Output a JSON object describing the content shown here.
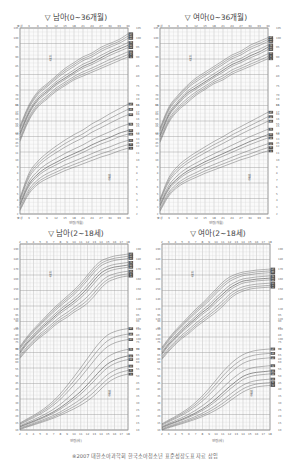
{
  "chart_data": [
    {
      "type": "line",
      "title": "▽ 남아(0~36개월)",
      "xlabel": "연령(개월)",
      "x_ticks": [
        "출생",
        "3",
        "6",
        "9",
        "12",
        "15",
        "18",
        "21",
        "24",
        "27",
        "30",
        "33",
        "36"
      ],
      "x": [
        0,
        3,
        6,
        9,
        12,
        15,
        18,
        21,
        24,
        27,
        30,
        33,
        36
      ],
      "upper_label": "신장",
      "lower_label": "체중",
      "height_ylim": [
        45,
        105
      ],
      "weight_ylim": [
        2,
        19
      ],
      "percentiles": [
        "3",
        "5",
        "10",
        "25",
        "50",
        "75",
        "90",
        "95",
        "97"
      ],
      "series": [
        {
          "name": "신장 50th",
          "values": [
            50,
            61,
            68,
            72,
            76,
            79,
            82,
            85,
            87,
            89.5,
            92,
            94,
            96
          ]
        },
        {
          "name": "신장 3rd",
          "values": [
            46,
            57,
            64,
            68,
            72,
            75,
            78,
            80,
            82,
            84,
            86,
            88,
            90
          ]
        },
        {
          "name": "신장 97th",
          "values": [
            54,
            65,
            72,
            76,
            80,
            84,
            87,
            90,
            92,
            95,
            97,
            99,
            102
          ]
        },
        {
          "name": "체중 50th",
          "values": [
            3.4,
            6.4,
            7.9,
            8.9,
            9.6,
            10.3,
            10.9,
            11.5,
            12.2,
            12.8,
            13.3,
            13.9,
            14.3
          ]
        },
        {
          "name": "체중 3rd",
          "values": [
            2.5,
            5.0,
            6.4,
            7.2,
            7.8,
            8.4,
            8.9,
            9.4,
            9.9,
            10.4,
            10.8,
            11.3,
            11.7
          ]
        },
        {
          "name": "체중 97th",
          "values": [
            4.4,
            8.0,
            9.8,
            11.0,
            12.0,
            12.9,
            13.7,
            14.4,
            15.3,
            16.0,
            16.8,
            17.5,
            18.2
          ]
        }
      ]
    },
    {
      "type": "line",
      "title": "▽ 여아(0~36개월)",
      "xlabel": "연령(개월)",
      "x_ticks": [
        "출생",
        "3",
        "6",
        "9",
        "12",
        "15",
        "18",
        "21",
        "24",
        "27",
        "30",
        "33",
        "36"
      ],
      "x": [
        0,
        3,
        6,
        9,
        12,
        15,
        18,
        21,
        24,
        27,
        30,
        33,
        36
      ],
      "upper_label": "신장",
      "lower_label": "체중",
      "height_ylim": [
        45,
        105
      ],
      "weight_ylim": [
        2,
        19
      ],
      "percentiles": [
        "3",
        "5",
        "10",
        "25",
        "50",
        "75",
        "90",
        "95",
        "97"
      ],
      "series": [
        {
          "name": "신장 50th",
          "values": [
            49,
            60,
            66,
            71,
            74,
            77,
            80,
            83,
            86,
            88,
            90.5,
            92.5,
            95
          ]
        },
        {
          "name": "신장 3rd",
          "values": [
            45.5,
            56,
            62,
            66,
            70,
            73,
            76,
            78,
            81,
            83,
            85,
            87,
            89
          ]
        },
        {
          "name": "신장 97th",
          "values": [
            53,
            64,
            70,
            75,
            79,
            82,
            85,
            88,
            91,
            93,
            96,
            98,
            100
          ]
        },
        {
          "name": "체중 50th",
          "values": [
            3.3,
            5.9,
            7.3,
            8.3,
            9.0,
            9.7,
            10.3,
            10.9,
            11.5,
            12.1,
            12.7,
            13.2,
            13.7
          ]
        },
        {
          "name": "체중 3rd",
          "values": [
            2.4,
            4.7,
            6.0,
            6.8,
            7.4,
            8.0,
            8.5,
            9.0,
            9.5,
            10.0,
            10.4,
            10.9,
            11.3
          ]
        },
        {
          "name": "체중 97th",
          "values": [
            4.2,
            7.4,
            9.1,
            10.2,
            11.1,
            11.9,
            12.7,
            13.4,
            14.2,
            14.9,
            15.6,
            16.3,
            17.0
          ]
        }
      ]
    },
    {
      "type": "line",
      "title": "▽ 남아(2~18세)",
      "xlabel": "연령(세)",
      "x_ticks": [
        "2",
        "3",
        "4",
        "5",
        "6",
        "7",
        "8",
        "9",
        "10",
        "11",
        "12",
        "13",
        "14",
        "15",
        "16",
        "17",
        "18"
      ],
      "x": [
        2,
        3,
        4,
        5,
        6,
        7,
        8,
        9,
        10,
        11,
        12,
        13,
        14,
        15,
        16,
        17,
        18
      ],
      "upper_label": "신장",
      "lower_label": "체중",
      "height_ylim": [
        80,
        195
      ],
      "weight_ylim": [
        10,
        95
      ],
      "percentiles": [
        "3",
        "5",
        "10",
        "25",
        "50",
        "75",
        "90",
        "95",
        "97"
      ],
      "series": [
        {
          "name": "신장 50th",
          "values": [
            87,
            96,
            103,
            110,
            116,
            122,
            128,
            133,
            138,
            144,
            151,
            159,
            166,
            170,
            172,
            173,
            174
          ]
        },
        {
          "name": "신장 3rd",
          "values": [
            81,
            89,
            96,
            102,
            107,
            113,
            118,
            122,
            127,
            131,
            136,
            143,
            151,
            157,
            160,
            162,
            163
          ]
        },
        {
          "name": "신장 97th",
          "values": [
            93,
            102,
            110,
            117,
            124,
            131,
            137,
            143,
            149,
            156,
            164,
            172,
            178,
            181,
            183,
            184,
            185
          ]
        },
        {
          "name": "체중 50th",
          "values": [
            12.5,
            14.6,
            16.5,
            18.6,
            20.9,
            23.5,
            26.6,
            30.2,
            34.2,
            38.5,
            43.6,
            49.0,
            54.4,
            58.8,
            61.6,
            63.4,
            64.6
          ]
        },
        {
          "name": "체중 3rd",
          "values": [
            10.4,
            12.1,
            13.7,
            15.3,
            17.0,
            18.8,
            20.9,
            23.2,
            25.6,
            28.3,
            31.5,
            35.4,
            40.2,
            44.8,
            48.0,
            50.0,
            51.2
          ]
        },
        {
          "name": "체중 97th",
          "values": [
            15.2,
            18.0,
            20.7,
            23.8,
            27.4,
            31.7,
            36.9,
            42.9,
            49.3,
            55.9,
            62.8,
            69.6,
            75.6,
            80.1,
            82.5,
            83.9,
            84.7
          ]
        }
      ]
    },
    {
      "type": "line",
      "title": "▽ 여아(2~18세)",
      "xlabel": "연령(세)",
      "x_ticks": [
        "2",
        "3",
        "4",
        "5",
        "6",
        "7",
        "8",
        "9",
        "10",
        "11",
        "12",
        "13",
        "14",
        "15",
        "16",
        "17",
        "18"
      ],
      "x": [
        2,
        3,
        4,
        5,
        6,
        7,
        8,
        9,
        10,
        11,
        12,
        13,
        14,
        15,
        16,
        17,
        18
      ],
      "upper_label": "신장",
      "lower_label": "체중",
      "height_ylim": [
        80,
        195
      ],
      "weight_ylim": [
        10,
        95
      ],
      "percentiles": [
        "3",
        "5",
        "10",
        "25",
        "50",
        "75",
        "90",
        "95",
        "97"
      ],
      "series": [
        {
          "name": "신장 50th",
          "values": [
            86,
            95,
            102,
            109,
            115,
            121,
            127,
            132,
            139,
            145,
            151,
            155,
            158,
            159,
            160,
            160.5,
            161
          ]
        },
        {
          "name": "신장 3rd",
          "values": [
            80,
            88,
            95,
            101,
            106,
            112,
            117,
            122,
            127,
            133,
            140,
            145,
            148,
            150,
            151,
            151.5,
            152
          ]
        },
        {
          "name": "신장 97th",
          "values": [
            92,
            101,
            109,
            116,
            123,
            130,
            136,
            143,
            150,
            157,
            162,
            165,
            167,
            168,
            169,
            169.5,
            170
          ]
        },
        {
          "name": "체중 50th",
          "values": [
            12.0,
            14.2,
            16.0,
            18.0,
            20.2,
            22.7,
            25.6,
            29.0,
            33.0,
            37.5,
            42.0,
            46.0,
            49.5,
            51.5,
            52.5,
            53.0,
            53.5
          ]
        },
        {
          "name": "체중 3rd",
          "values": [
            10.0,
            11.7,
            13.2,
            14.7,
            16.3,
            18.0,
            19.9,
            22.1,
            24.7,
            27.7,
            31.2,
            34.8,
            38.0,
            40.3,
            41.7,
            42.4,
            42.8
          ]
        },
        {
          "name": "체중 97th",
          "values": [
            14.6,
            17.4,
            20.0,
            23.0,
            26.4,
            30.5,
            35.3,
            40.8,
            46.8,
            52.8,
            58.0,
            62.3,
            65.5,
            67.5,
            68.7,
            69.3,
            69.7
          ]
        }
      ]
    }
  ],
  "panels": [
    {
      "title": "▽ 남아(0~36개월)",
      "xlabel": "연령(개월)",
      "upper_label": "신장",
      "lower_label": "체중"
    },
    {
      "title": "▽ 여아(0~36개월)",
      "xlabel": "연령(개월)",
      "upper_label": "신장",
      "lower_label": "체중"
    },
    {
      "title": "▽ 남아(2~18세)",
      "xlabel": "연령(세)",
      "upper_label": "신장",
      "lower_label": "체중"
    },
    {
      "title": "▽ 여아(2~18세)",
      "xlabel": "연령(세)",
      "upper_label": "신장",
      "lower_label": "체중"
    }
  ],
  "footer": "※2007 대한소아과학회 한국소아청소년 표준성장도표 자료 삽입",
  "colors": {
    "grid": "#bdbdbd",
    "grid_major": "#9a9a9a",
    "curve": "#6e6e6e",
    "frame": "#7a7a7a",
    "shade": "#e9e9e9"
  }
}
